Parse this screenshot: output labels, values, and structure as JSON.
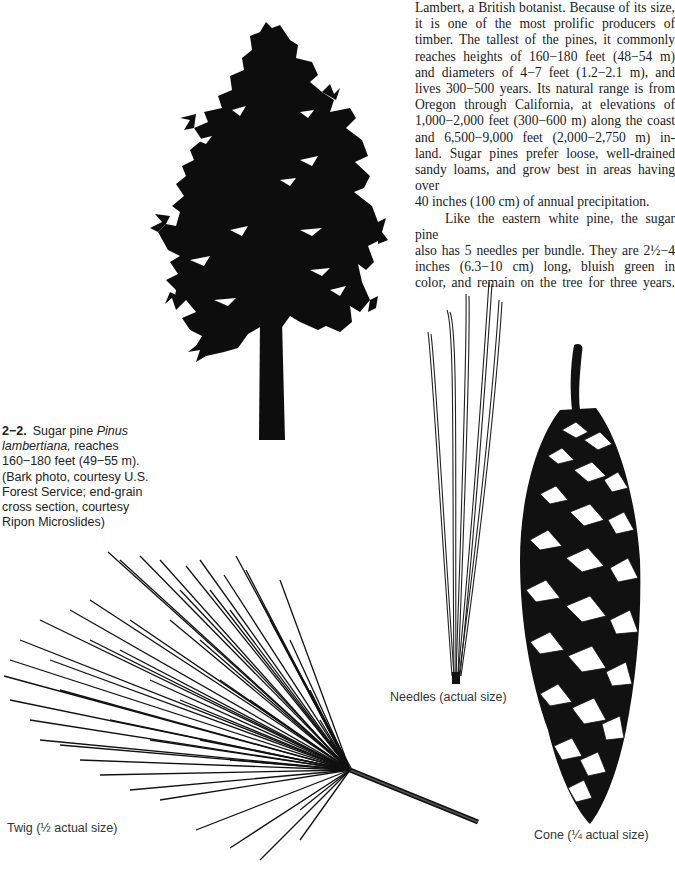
{
  "body_text": {
    "paragraph_1": "Lambert, a British botanist. Because of its size, it is one of the most prolific producers of timber. The tallest of the pines, it commonly reaches heights of 160−180 feet (48−54 m) and diameters of 4−7 feet (1.2−2.1 m), and lives 300−500 years. Its natural range is from Oregon through California, at elevations of 1,000−2,000 feet (300−600 m) along the coast and 6,500−9,000 feet (2,000−2,750 m) in-land. Sugar pines prefer loose, well-drained sandy loams, and grow best in areas having over 40 inches (100 cm) of annual precipitation.",
    "paragraph_1_lines": [
      "Lambert, a British botanist. Because of its size,",
      "it is one of the most prolific producers of",
      "timber. The tallest of the pines, it commonly",
      "reaches heights of 160−180 feet (48−54 m)",
      "and diameters of 4−7 feet (1.2−2.1 m), and",
      "lives 300−500 years. Its natural range is from",
      "Oregon through California, at elevations of",
      "1,000−2,000 feet (300−600 m) along the coast",
      "and 6,500−9,000 feet (2,000−2,750 m) in-",
      "land. Sugar pines prefer loose, well-drained",
      "sandy loams, and grow best in areas having over",
      "40 inches (100 cm) of annual precipitation."
    ],
    "paragraph_2_lines": [
      "Like the eastern white pine, the sugar pine",
      "also has 5 needles per bundle. They are 2½−4",
      "inches (6.3−10 cm) long, bluish green in",
      "color, and remain on the tree for three years."
    ]
  },
  "figure": {
    "number": "2−2.",
    "caption_pre": "Sugar pine ",
    "species": "Pinus lambertiana,",
    "caption_post": " reaches 160−180 feet (49−55 m). (Bark photo, courtesy U.S. Forest Service; end-grain cross section, courtesy Ripon Microslides)",
    "illustrations": [
      {
        "name": "tree-silhouette",
        "label": ""
      },
      {
        "name": "needles",
        "label": "Needles (actual size)"
      },
      {
        "name": "cone",
        "label": "Cone (¼ actual size)"
      },
      {
        "name": "twig",
        "label": "Twig (½ actual size)"
      }
    ]
  },
  "colors": {
    "ink": "#111111",
    "paper": "#ffffff"
  }
}
